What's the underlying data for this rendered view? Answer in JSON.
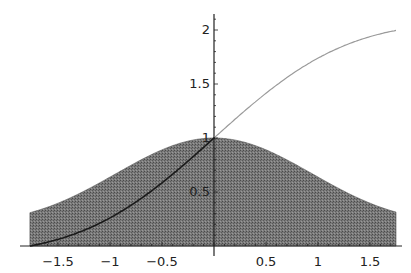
{
  "chart_data": {
    "type": "area",
    "title": "",
    "xlabel": "",
    "ylabel": "",
    "xlim": [
      -1.77,
      1.75
    ],
    "ylim": [
      0,
      2.15
    ],
    "grid": false,
    "legend": null,
    "x_ticks": [
      -1.5,
      -1,
      -0.5,
      0.5,
      1,
      1.5
    ],
    "x_tick_labels": [
      "-1.5",
      "-1",
      "-0.5",
      "0.5",
      "1",
      "1.5"
    ],
    "y_ticks": [
      0.5,
      1,
      1.5,
      2
    ],
    "y_tick_labels": [
      "0.5",
      "1",
      "1.5",
      "2"
    ],
    "series": [
      {
        "name": "shaded density exp(-x^2/2)",
        "style": "filled area, dark gray stipple",
        "x": [
          -1.77,
          -1.5,
          -1.25,
          -1,
          -0.75,
          -0.5,
          -0.25,
          0,
          0.25,
          0.5,
          0.75,
          1,
          1.25,
          1.5,
          1.75
        ],
        "values": [
          0.21,
          0.32,
          0.46,
          0.61,
          0.75,
          0.88,
          0.97,
          1.0,
          0.97,
          0.88,
          0.75,
          0.61,
          0.46,
          0.32,
          0.22
        ]
      },
      {
        "name": "cumulative integral curve",
        "style": "thin line",
        "x": [
          -1.77,
          -1.5,
          -1.25,
          -1,
          -0.75,
          -0.5,
          -0.25,
          0,
          0.25,
          0.5,
          0.75,
          1,
          1.25,
          1.5,
          1.75
        ],
        "values": [
          0.0,
          0.06,
          0.16,
          0.29,
          0.44,
          0.62,
          0.81,
          1.0,
          1.19,
          1.38,
          1.56,
          1.71,
          1.84,
          1.94,
          2.08
        ]
      }
    ]
  },
  "colors": {
    "fill": "#6e6e6e",
    "curve_over_fill": "#1a1a1a",
    "curve_light": "#9a9a9a",
    "axis": "#222222"
  }
}
